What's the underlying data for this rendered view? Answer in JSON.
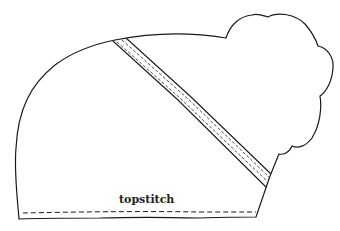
{
  "diagram": {
    "type": "sewing-pattern-illustration",
    "labels": {
      "topstitch": "topstitch"
    },
    "colors": {
      "line": "#1a1a1a",
      "background": "#ffffff"
    }
  }
}
